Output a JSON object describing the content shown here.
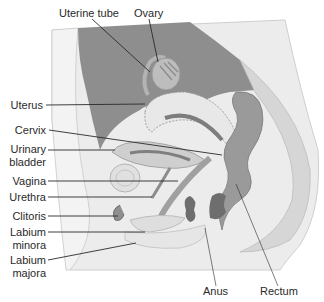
{
  "figure": {
    "colors": {
      "background": "#ffffff",
      "body_light": "#ececec",
      "body_mid": "#d9d9d9",
      "cavity_dark": "#8a8a8a",
      "organ_mid": "#a8a8a8",
      "organ_dark": "#6e6e6e",
      "leader_line": "#2a2a2a",
      "label_text": "#2a2a2a"
    }
  },
  "labels": {
    "uterine_tube": "Uterine tube",
    "ovary": "Ovary",
    "uterus": "Uterus",
    "cervix": "Cervix",
    "urinary_bladder_line1": "Urinary",
    "urinary_bladder_line2": "bladder",
    "vagina": "Vagina",
    "urethra": "Urethra",
    "clitoris": "Clitoris",
    "labium_minora_line1": "Labium",
    "labium_minora_line2": "minora",
    "labium_majora_line1": "Labium",
    "labium_majora_line2": "majora",
    "anus": "Anus",
    "rectum": "Rectum"
  }
}
